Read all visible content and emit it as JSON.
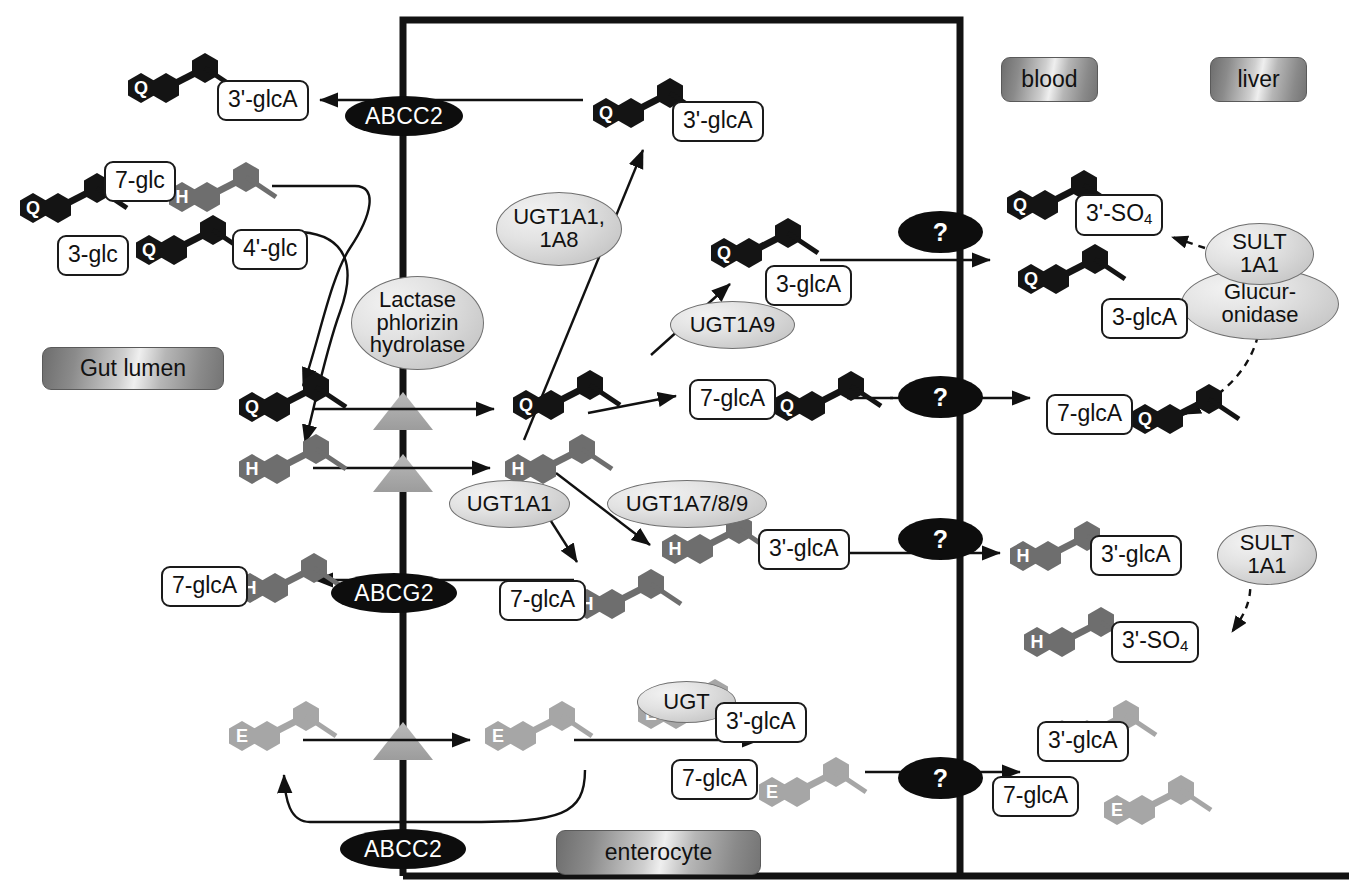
{
  "diagram": {
    "compartments": [
      {
        "id": "gut-lumen",
        "label": "Gut lumen",
        "x": 42,
        "y": 347,
        "w": 182,
        "h": 43
      },
      {
        "id": "enterocyte",
        "label": "enterocyte",
        "x": 556,
        "y": 830,
        "w": 205,
        "h": 45
      },
      {
        "id": "blood",
        "label": "blood",
        "x": 1001,
        "y": 57,
        "w": 97,
        "h": 45
      },
      {
        "id": "liver",
        "label": "liver",
        "x": 1210,
        "y": 57,
        "w": 97,
        "h": 45
      }
    ],
    "transporters": [
      {
        "id": "abcc2-top",
        "label": "ABCC2",
        "x": 345,
        "y": 96,
        "w": 118,
        "h": 40
      },
      {
        "id": "abcg2",
        "label": "ABCG2",
        "x": 331,
        "y": 573,
        "w": 126,
        "h": 40
      },
      {
        "id": "abcc2-bottom",
        "label": "ABCC2",
        "x": 340,
        "y": 829,
        "w": 126,
        "h": 40
      },
      {
        "id": "unknown-q-sulfate",
        "label": "?",
        "x": 898,
        "y": 211,
        "w": 85,
        "h": 42
      },
      {
        "id": "unknown-q-7glca",
        "label": "?",
        "x": 898,
        "y": 376,
        "w": 85,
        "h": 42
      },
      {
        "id": "unknown-h-3glca",
        "label": "?",
        "x": 898,
        "y": 518,
        "w": 85,
        "h": 42
      },
      {
        "id": "unknown-e-glca",
        "label": "?",
        "x": 898,
        "y": 757,
        "w": 85,
        "h": 42
      }
    ],
    "enzymes": [
      {
        "id": "lactase-phlorizin-hydrolase",
        "label": "Lactase\nphlorizin\nhydrolase",
        "x": 351,
        "y": 276,
        "w": 133,
        "h": 94
      },
      {
        "id": "ugt1a1-1a8",
        "label": "UGT1A1,\n1A8",
        "x": 496,
        "y": 192,
        "w": 126,
        "h": 74
      },
      {
        "id": "ugt1a9",
        "label": "UGT1A9",
        "x": 670,
        "y": 301,
        "w": 125,
        "h": 48
      },
      {
        "id": "ugt1a1",
        "label": "UGT1A1",
        "x": 449,
        "y": 480,
        "w": 121,
        "h": 48
      },
      {
        "id": "ugt1a7-8-9",
        "label": "UGT1A7/8/9",
        "x": 607,
        "y": 480,
        "w": 160,
        "h": 48
      },
      {
        "id": "ugt",
        "label": "UGT",
        "x": 637,
        "y": 681,
        "w": 99,
        "h": 42
      },
      {
        "id": "sult1a1-liver",
        "label": "SULT\n1A1",
        "x": 1205,
        "y": 223,
        "w": 109,
        "h": 62
      },
      {
        "id": "glucuronidase-liver",
        "label": "Glucur-\nonidase",
        "x": 1181,
        "y": 268,
        "w": 158,
        "h": 72
      },
      {
        "id": "sult1a1-blood",
        "label": "SULT\n1A1",
        "x": 1217,
        "y": 525,
        "w": 100,
        "h": 60
      }
    ],
    "labels": [
      {
        "id": "q-3prime-glca-lumen",
        "text": "3'-glcA",
        "x": 217,
        "y": 80
      },
      {
        "id": "q-7-glc",
        "text": "7-glc",
        "x": 104,
        "y": 161
      },
      {
        "id": "q-3-glc",
        "text": "3-glc",
        "x": 57,
        "y": 235
      },
      {
        "id": "q-4prime-glc",
        "text": "4'-glc",
        "x": 232,
        "y": 229
      },
      {
        "id": "q-3prime-glca-ent",
        "text": "3'-glcA",
        "x": 672,
        "y": 101
      },
      {
        "id": "q-3-glca-ent",
        "text": "3-glcA",
        "x": 765,
        "y": 265
      },
      {
        "id": "q-7-glca-ent",
        "text": "7-glcA",
        "x": 689,
        "y": 379
      },
      {
        "id": "h-7-glca-lumen",
        "text": "7-glcA",
        "x": 161,
        "y": 566
      },
      {
        "id": "h-7-glca-ent",
        "text": "7-glcA",
        "x": 499,
        "y": 580
      },
      {
        "id": "h-3prime-glca-ent",
        "text": "3'-glcA",
        "x": 758,
        "y": 529
      },
      {
        "id": "q-3prime-so4-blood",
        "text": "3'-SO4",
        "x": 1075,
        "y": 194,
        "sub": "4"
      },
      {
        "id": "q-3-glca-blood",
        "text": "3-glcA",
        "x": 1101,
        "y": 298
      },
      {
        "id": "q-7-glca-blood",
        "text": "7-glcA",
        "x": 1046,
        "y": 394
      },
      {
        "id": "h-3prime-glca-blood",
        "text": "3'-glcA",
        "x": 1090,
        "y": 535
      },
      {
        "id": "h-3prime-so4-blood",
        "text": "3'-SO4",
        "x": 1111,
        "y": 621,
        "sub": "4"
      },
      {
        "id": "e-3prime-glca-ent",
        "text": "3'-glcA",
        "x": 715,
        "y": 702
      },
      {
        "id": "e-7-glca-ent",
        "text": "7-glcA",
        "x": 671,
        "y": 759
      },
      {
        "id": "e-3prime-glca-blood",
        "text": "3'-glcA",
        "x": 1037,
        "y": 721
      },
      {
        "id": "e-7-glca-blood",
        "text": "7-glcA",
        "x": 992,
        "y": 776
      }
    ],
    "molecules": [
      {
        "id": "mol-q-3prime-glca-lumen",
        "core": "Q",
        "color": "black",
        "x": 126,
        "y": 66
      },
      {
        "id": "mol-q-aglycone-lumen",
        "core": "Q",
        "color": "black",
        "x": 18,
        "y": 186
      },
      {
        "id": "mol-h-7glc-lumen",
        "core": "H",
        "color": "gray",
        "x": 167,
        "y": 175
      },
      {
        "id": "mol-q-4prime-glc-lumen",
        "core": "Q",
        "color": "black",
        "x": 134,
        "y": 228
      },
      {
        "id": "mol-q-aglycone-gut",
        "core": "Q",
        "color": "black",
        "x": 237,
        "y": 385
      },
      {
        "id": "mol-h-aglycone-gut",
        "core": "H",
        "color": "gray",
        "x": 237,
        "y": 447
      },
      {
        "id": "mol-q-3prime-glca-ent",
        "core": "Q",
        "color": "black",
        "x": 591,
        "y": 91
      },
      {
        "id": "mol-q-3-glca-ent",
        "core": "Q",
        "color": "black",
        "x": 709,
        "y": 231
      },
      {
        "id": "mol-q-aglycone-ent",
        "core": "Q",
        "color": "black",
        "x": 511,
        "y": 383
      },
      {
        "id": "mol-h-aglycone-ent",
        "core": "H",
        "color": "gray",
        "x": 503,
        "y": 447
      },
      {
        "id": "mol-q-7glca-ent",
        "core": "Q",
        "color": "black",
        "x": 772,
        "y": 384
      },
      {
        "id": "mol-h-7glca-lumen",
        "core": "H",
        "color": "gray",
        "x": 235,
        "y": 566
      },
      {
        "id": "mol-h-7glca-ent",
        "core": "H",
        "color": "gray",
        "x": 572,
        "y": 582
      },
      {
        "id": "mol-h-3prime-glca-ent",
        "core": "H",
        "color": "gray",
        "x": 660,
        "y": 527
      },
      {
        "id": "mol-q-3prime-so4-blood",
        "core": "Q",
        "color": "black",
        "x": 1005,
        "y": 183
      },
      {
        "id": "mol-q-3-glca-blood",
        "core": "Q",
        "color": "black",
        "x": 1016,
        "y": 257
      },
      {
        "id": "mol-q-7glca-blood",
        "core": "Q",
        "color": "black",
        "x": 1130,
        "y": 397
      },
      {
        "id": "mol-h-3prime-glca-blood",
        "core": "H",
        "color": "gray",
        "x": 1008,
        "y": 534
      },
      {
        "id": "mol-h-3prime-so4-blood",
        "core": "H",
        "color": "gray",
        "x": 1022,
        "y": 620
      },
      {
        "id": "mol-e-aglycone-gut",
        "core": "E",
        "color": "lightgray",
        "x": 227,
        "y": 714
      },
      {
        "id": "mol-e-aglycone-ent",
        "core": "E",
        "color": "lightgray",
        "x": 483,
        "y": 714
      },
      {
        "id": "mol-e-3prime-glca-ent",
        "core": "E",
        "color": "lightgray",
        "x": 636,
        "y": 692
      },
      {
        "id": "mol-e-7glca-ent",
        "core": "E",
        "color": "lightgray",
        "x": 757,
        "y": 770
      },
      {
        "id": "mol-e-3prime-glca-blood",
        "core": "E",
        "color": "lightgray",
        "x": 1047,
        "y": 713
      },
      {
        "id": "mol-e-7glca-blood",
        "color": "lightgray",
        "core": "E",
        "x": 1102,
        "y": 788
      }
    ],
    "colors": {
      "quercetin": "#141414",
      "hesperetin": "#6e6e6e",
      "epicatechin": "#a6a6a6",
      "membrane": "#141414",
      "transporter_fill": "#0d0d0d",
      "enzyme_fill": "#d6d6d6",
      "label_border": "#1a1a1a"
    }
  }
}
